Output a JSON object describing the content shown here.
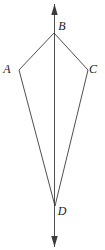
{
  "figure": {
    "name": "kite-abcd-with-axis-of-symmetry",
    "type": "geometry-diagram",
    "canvas": {
      "width": 105,
      "height": 250,
      "background": "#ffffff"
    },
    "stroke": {
      "color": "#3b3b3b",
      "width": 0.9
    },
    "label_color": "#1a1a1a",
    "label_font_size": 12
  },
  "points": {
    "A": {
      "label": "A",
      "x": 19,
      "y": 70,
      "label_x": 7,
      "label_y": 70
    },
    "B": {
      "label": "B",
      "x": 54,
      "y": 33,
      "label_x": 62,
      "label_y": 27
    },
    "C": {
      "label": "C",
      "x": 88,
      "y": 70,
      "label_x": 93,
      "label_y": 70
    },
    "D": {
      "label": "D",
      "x": 55,
      "y": 206,
      "label_x": 62,
      "label_y": 212
    }
  },
  "segments": [
    {
      "name": "segment-AB",
      "from": "A",
      "to": "B",
      "x1": 19,
      "y1": 70,
      "x2": 54,
      "y2": 33
    },
    {
      "name": "segment-BC",
      "from": "B",
      "to": "C",
      "x1": 54,
      "y1": 33,
      "x2": 88,
      "y2": 70
    },
    {
      "name": "segment-AD",
      "from": "A",
      "to": "D",
      "x1": 19,
      "y1": 70,
      "x2": 55,
      "y2": 206
    },
    {
      "name": "segment-CD",
      "from": "C",
      "to": "D",
      "x1": 88,
      "y1": 70,
      "x2": 55,
      "y2": 206
    }
  ],
  "axis": {
    "name": "axis-of-symmetry",
    "x": 54.5,
    "y_top": 4,
    "y_bottom": 247,
    "arrow_top": true,
    "arrow_bottom": true,
    "arrow_half_width": 3.2,
    "arrow_length": 11
  }
}
